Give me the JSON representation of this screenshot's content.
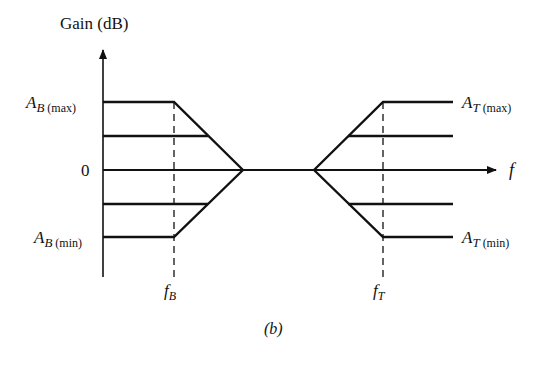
{
  "diagram": {
    "y_axis_label": "Gain (dB)",
    "x_axis_label": "f",
    "caption": "(b)",
    "left_labels": {
      "max": {
        "main": "A",
        "sub": "B",
        "paren": "(max)"
      },
      "zero": "0",
      "min": {
        "main": "A",
        "sub": "B",
        "paren": "(min)"
      }
    },
    "right_labels": {
      "max": {
        "main": "A",
        "sub": "T",
        "paren": "(max)"
      },
      "min": {
        "main": "A",
        "sub": "T",
        "paren": "(min)"
      }
    },
    "freq_labels": {
      "fB": {
        "main": "f",
        "sub": "B"
      },
      "fT": {
        "main": "f",
        "sub": "T"
      }
    },
    "line_color": "#111111"
  }
}
